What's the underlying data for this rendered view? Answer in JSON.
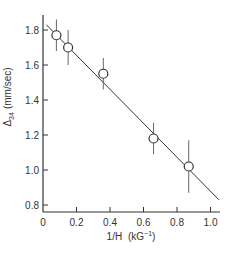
{
  "chart_data": {
    "type": "scatter",
    "title": "",
    "xlabel": "1/H (kG⁻¹)",
    "ylabel": "Δ₃₄ (mm/sec)",
    "xlim": [
      0,
      1.05
    ],
    "ylim": [
      0.78,
      1.87
    ],
    "x_ticks": [
      0,
      0.2,
      0.4,
      0.6,
      0.8,
      1.0
    ],
    "x_tick_labels": [
      "0",
      "0.2",
      "0.4",
      "0.6",
      "0.8",
      "1.0"
    ],
    "y_ticks": [
      0.8,
      1.0,
      1.2,
      1.4,
      1.6,
      1.8
    ],
    "y_tick_labels": [
      "0.8",
      "1.0",
      "1.2",
      "1.4",
      "1.6",
      "1.8"
    ],
    "grid": false,
    "legend": null,
    "series": [
      {
        "name": "data",
        "marker": "open-circle",
        "x": [
          0.08,
          0.15,
          0.36,
          0.66,
          0.87
        ],
        "y": [
          1.77,
          1.7,
          1.55,
          1.18,
          1.02
        ],
        "yerr": [
          0.09,
          0.1,
          0.09,
          0.09,
          0.15
        ]
      },
      {
        "name": "fit",
        "type": "line",
        "x": [
          0.02,
          1.05
        ],
        "y": [
          1.83,
          0.83
        ]
      }
    ]
  },
  "axes": {
    "x_label_main": "1/H",
    "x_label_unit": "(kG",
    "x_label_exp": "−1",
    "x_label_close": ")",
    "y_label_delta": "Δ",
    "y_label_sub": "34",
    "y_label_unit": "(mm/sec)"
  },
  "colors": {
    "ink": "#333333",
    "background": "#ffffff"
  }
}
